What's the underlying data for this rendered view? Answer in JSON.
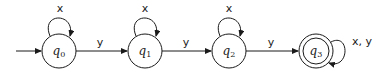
{
  "diagram": {
    "type": "finite-automaton",
    "states": [
      {
        "id": "q0",
        "name": "q",
        "sub": "0",
        "initial": true,
        "accepting": false
      },
      {
        "id": "q1",
        "name": "q",
        "sub": "1",
        "initial": false,
        "accepting": false
      },
      {
        "id": "q2",
        "name": "q",
        "sub": "2",
        "initial": false,
        "accepting": false
      },
      {
        "id": "q3",
        "name": "q",
        "sub": "3",
        "initial": false,
        "accepting": true
      }
    ],
    "transitions": [
      {
        "from": "q0",
        "to": "q0",
        "label": "x"
      },
      {
        "from": "q0",
        "to": "q1",
        "label": "y"
      },
      {
        "from": "q1",
        "to": "q1",
        "label": "x"
      },
      {
        "from": "q1",
        "to": "q2",
        "label": "y"
      },
      {
        "from": "q2",
        "to": "q2",
        "label": "x"
      },
      {
        "from": "q2",
        "to": "q3",
        "label": "y"
      },
      {
        "from": "q3",
        "to": "q3",
        "label": "x, y"
      }
    ]
  }
}
